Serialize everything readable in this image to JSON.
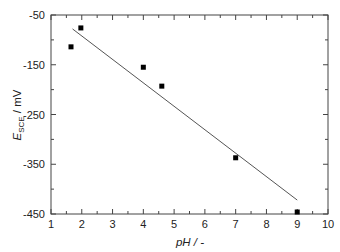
{
  "chart_data": {
    "type": "scatter",
    "title": "",
    "xlabel": "pH / -",
    "ylabel": "E_SCE / mV",
    "ylabel_parts": {
      "main": "E",
      "sub": "SCE",
      "rest": " / mV"
    },
    "xlim": [
      1,
      10
    ],
    "ylim": [
      -450,
      -50
    ],
    "xticks": [
      1,
      2,
      3,
      4,
      5,
      6,
      7,
      8,
      9,
      10
    ],
    "yticks": [
      -50,
      -150,
      -250,
      -350,
      -450
    ],
    "grid": false,
    "legend": null,
    "series": [
      {
        "name": "measured",
        "marker": "square",
        "x": [
          1.65,
          1.97,
          4.0,
          4.6,
          7.0,
          9.0
        ],
        "y": [
          -114,
          -76,
          -155,
          -193,
          -337,
          -446
        ]
      },
      {
        "name": "linear fit",
        "type": "line",
        "x": [
          1.7,
          9.0
        ],
        "y": [
          -78,
          -422
        ]
      }
    ],
    "colors": {
      "axis": "#444444",
      "marker": "#000000",
      "line": "#555555"
    }
  }
}
